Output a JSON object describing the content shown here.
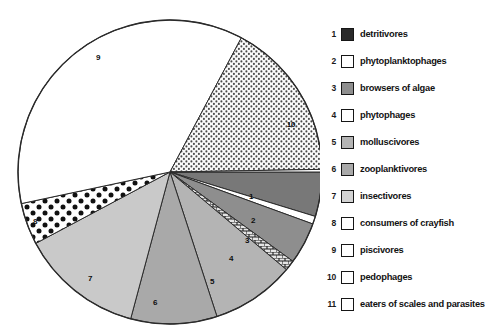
{
  "chart_data": {
    "type": "pie",
    "title": "",
    "xlabel": "",
    "ylabel": "",
    "legend_position": "right",
    "grid": false,
    "units": "degrees of arc",
    "total_degrees": 360,
    "categories": [
      "detritivores",
      "phytoplanktophages",
      "browsers of algae",
      "phytophages",
      "molluscivores",
      "zooplanktivores",
      "insectivores",
      "consumers of crayfish",
      "piscivores",
      "pedophages",
      "eaters of scales and parasites"
    ],
    "values": [
      17,
      3,
      16,
      4,
      32,
      33,
      47,
      16,
      130,
      61,
      1
    ],
    "percentages": [
      4.7,
      0.8,
      4.4,
      1.1,
      8.9,
      9.2,
      13.1,
      4.4,
      36.1,
      16.9,
      0.3
    ],
    "slices": [
      {
        "index": "1",
        "label": "detritivores",
        "start_deg": 0,
        "end_deg": 17,
        "fill": "solid-dark",
        "color": "#787878",
        "label_x": 251,
        "label_y": 196
      },
      {
        "index": "2",
        "label": "phytoplanktophages",
        "start_deg": 17,
        "end_deg": 20,
        "fill": "solid-white",
        "color": "#ffffff",
        "label_x": 253,
        "label_y": 220
      },
      {
        "index": "3",
        "label": "browsers of algae",
        "start_deg": 20,
        "end_deg": 36,
        "fill": "solid-mid",
        "color": "#8e8e8e",
        "label_x": 247,
        "label_y": 240
      },
      {
        "index": "4",
        "label": "phytophages",
        "start_deg": 36,
        "end_deg": 40,
        "fill": "brick",
        "color": "#cfcfcf",
        "label_x": 231,
        "label_y": 258
      },
      {
        "index": "5",
        "label": "molluscivores",
        "start_deg": 40,
        "end_deg": 72,
        "fill": "solid-light",
        "color": "#b4b4b4",
        "label_x": 212,
        "label_y": 281
      },
      {
        "index": "6",
        "label": "zooplanktivores",
        "start_deg": 72,
        "end_deg": 105,
        "fill": "solid-light2",
        "color": "#a9a9a9",
        "label_x": 155,
        "label_y": 302
      },
      {
        "index": "7",
        "label": "insectivores",
        "start_deg": 105,
        "end_deg": 152,
        "fill": "solid-pale",
        "color": "#c9c9c9",
        "label_x": 90,
        "label_y": 278
      },
      {
        "index": "8",
        "label": "consumers of crayfish",
        "start_deg": 152,
        "end_deg": 168,
        "fill": "polka",
        "color": "#ffffff",
        "label_x": 35,
        "label_y": 221
      },
      {
        "index": "9",
        "label": "piscivores",
        "start_deg": 168,
        "end_deg": 298,
        "fill": "solid-white",
        "color": "#ffffff",
        "label_x": 98,
        "label_y": 57
      },
      {
        "index": "10",
        "label": "pedophages",
        "start_deg": 298,
        "end_deg": 359,
        "fill": "dots",
        "color": "#f2f2f2",
        "label_x": 291,
        "label_y": 124
      },
      {
        "index": "11",
        "label": "eaters of scales and parasites",
        "start_deg": 359,
        "end_deg": 360,
        "fill": "solid-white",
        "color": "#ffffff",
        "label_x": 0,
        "label_y": 0
      }
    ]
  },
  "pie": {
    "center_x": 170,
    "center_y": 172,
    "radius": 152,
    "outline_color": "#2b2b2b"
  },
  "legend": {
    "title": "",
    "items": [
      {
        "index": "1",
        "label": "detritivores",
        "swatch": "solid-dark"
      },
      {
        "index": "2",
        "label": "phytoplanktophages",
        "swatch": "solid-white"
      },
      {
        "index": "3",
        "label": "browsers of algae",
        "swatch": "solid-mid"
      },
      {
        "index": "4",
        "label": "phytophages",
        "swatch": "brick"
      },
      {
        "index": "5",
        "label": "molluscivores",
        "swatch": "solid-light"
      },
      {
        "index": "6",
        "label": "zooplanktivores",
        "swatch": "solid-light2"
      },
      {
        "index": "7",
        "label": "insectivores",
        "swatch": "solid-pale"
      },
      {
        "index": "8",
        "label": "consumers of crayfish",
        "swatch": "polka"
      },
      {
        "index": "9",
        "label": "piscivores",
        "swatch": "solid-white"
      },
      {
        "index": "10",
        "label": "pedophages",
        "swatch": "dots"
      },
      {
        "index": "11",
        "label": "eaters of scales and parasites",
        "swatch": "solid-white"
      }
    ]
  },
  "colors": {
    "solid_dark": "#2a2a2a",
    "solid_white": "#ffffff",
    "solid_mid": "#8e8e8e",
    "solid_light": "#b4b4b4",
    "solid_light2": "#a9a9a9",
    "solid_pale": "#c9c9c9",
    "outline": "#161616",
    "text": "#121212"
  }
}
